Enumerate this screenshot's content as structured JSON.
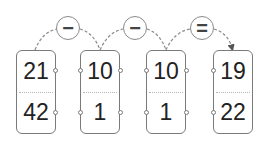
{
  "diagram": {
    "operators": [
      {
        "symbol": "−",
        "name": "minus"
      },
      {
        "symbol": "−",
        "name": "minus"
      },
      {
        "symbol": "=",
        "name": "equals"
      }
    ],
    "cards": [
      {
        "top": "21",
        "bottom": "42"
      },
      {
        "top": "10",
        "bottom": "1"
      },
      {
        "top": "10",
        "bottom": "1"
      },
      {
        "top": "19",
        "bottom": "22"
      }
    ],
    "colors": {
      "stroke": "#7a7a7a",
      "text": "#222222",
      "link": "#8a8a8a"
    }
  }
}
